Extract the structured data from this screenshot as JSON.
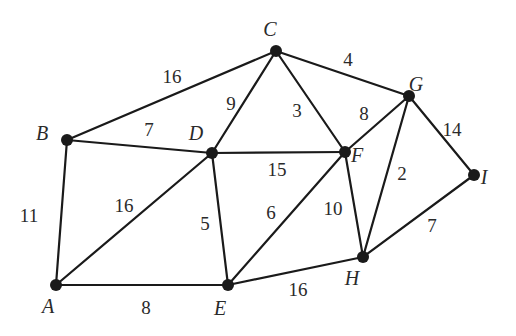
{
  "graph": {
    "type": "weighted-undirected-graph",
    "nodes": [
      {
        "id": "A",
        "label": "A"
      },
      {
        "id": "B",
        "label": "B"
      },
      {
        "id": "C",
        "label": "C"
      },
      {
        "id": "D",
        "label": "D"
      },
      {
        "id": "E",
        "label": "E"
      },
      {
        "id": "F",
        "label": "F"
      },
      {
        "id": "G",
        "label": "G"
      },
      {
        "id": "H",
        "label": "H"
      },
      {
        "id": "I",
        "label": "I"
      }
    ],
    "edges": [
      {
        "from": "A",
        "to": "B",
        "weight": "11"
      },
      {
        "from": "A",
        "to": "D",
        "weight": "16"
      },
      {
        "from": "A",
        "to": "E",
        "weight": "8"
      },
      {
        "from": "B",
        "to": "C",
        "weight": "16"
      },
      {
        "from": "B",
        "to": "D",
        "weight": "7"
      },
      {
        "from": "C",
        "to": "D",
        "weight": "9"
      },
      {
        "from": "C",
        "to": "F",
        "weight": "3"
      },
      {
        "from": "C",
        "to": "G",
        "weight": "4"
      },
      {
        "from": "D",
        "to": "F",
        "weight": "15"
      },
      {
        "from": "D",
        "to": "E",
        "weight": "5"
      },
      {
        "from": "E",
        "to": "F",
        "weight": "6"
      },
      {
        "from": "E",
        "to": "H",
        "weight": "16"
      },
      {
        "from": "F",
        "to": "G",
        "weight": "8"
      },
      {
        "from": "F",
        "to": "H",
        "weight": "10"
      },
      {
        "from": "G",
        "to": "H",
        "weight": "2"
      },
      {
        "from": "G",
        "to": "I",
        "weight": "14"
      },
      {
        "from": "H",
        "to": "I",
        "weight": "7"
      }
    ]
  }
}
